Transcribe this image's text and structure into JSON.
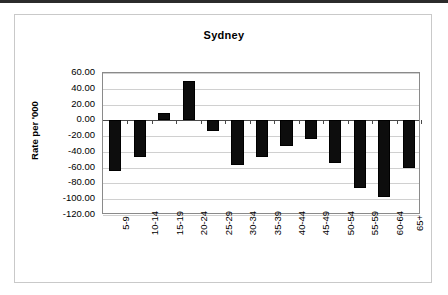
{
  "chart_data": {
    "type": "bar",
    "title": "Sydney",
    "xlabel": "",
    "ylabel": "Rate per '000",
    "categories": [
      "5-9",
      "10-14",
      "15-19",
      "20-24",
      "25-29",
      "30-34",
      "35-39",
      "40-44",
      "45-49",
      "50-54",
      "55-59",
      "60-64",
      "65+"
    ],
    "values": [
      -64.0,
      -47.0,
      9.0,
      50.0,
      -14.0,
      -57.0,
      -47.0,
      -33.0,
      -24.0,
      -54.0,
      -86.0,
      -97.0,
      -61.0
    ],
    "ylim": [
      -120.0,
      60.0
    ],
    "ytick_labels": [
      "60.00",
      "40.00",
      "20.00",
      "0.00",
      "-20.00",
      "-40.00",
      "-60.00",
      "-80.00",
      "-100.00",
      "-120.00"
    ],
    "ytick_values": [
      60,
      40,
      20,
      0,
      -20,
      -40,
      -60,
      -80,
      -100,
      -120
    ],
    "grid": true,
    "legend": false,
    "bar_color": "#0d0d0d",
    "plot_border_color": "#8a8a8a",
    "gridline_color": "#d0d0d0",
    "frame_color": "#c9c9c9",
    "background_color": "#ffffff"
  }
}
